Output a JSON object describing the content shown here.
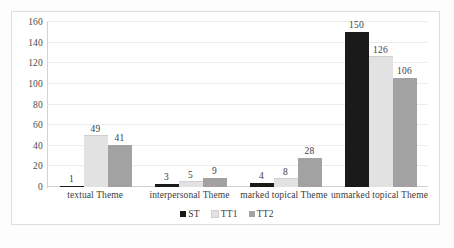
{
  "chart_data": {
    "type": "bar",
    "title": "",
    "subtitle": "",
    "xlabel": "",
    "ylabel": "",
    "categories": [
      "textual Theme",
      "interpersonal Theme",
      "marked topical Theme",
      "unmarked topical Theme"
    ],
    "series": [
      {
        "name": "ST",
        "color": "#1a1a1a",
        "values": [
          1,
          3,
          4,
          150
        ]
      },
      {
        "name": "TT1",
        "color": "#e2e2e2",
        "values": [
          49,
          5,
          8,
          126
        ]
      },
      {
        "name": "TT2",
        "color": "#a2a2a2",
        "values": [
          41,
          9,
          28,
          106
        ]
      }
    ],
    "ylim": [
      0,
      160
    ],
    "y_ticks": [
      160,
      140,
      120,
      100,
      80,
      60,
      40,
      20,
      0
    ],
    "grid": true,
    "data_labels": true,
    "legend_position": "bottom"
  }
}
